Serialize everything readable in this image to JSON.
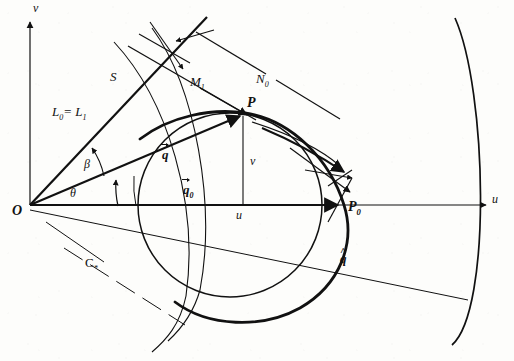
{
  "figure": {
    "style": "hand-drawn line diagram, black ink on off-white paper",
    "width": 514,
    "height": 361,
    "ink_color": "#111111",
    "paper_color": "#fdfdfb"
  },
  "axes": {
    "vertical_label": "v",
    "horizontal_label": "u",
    "origin_label": "O"
  },
  "points": [
    {
      "id": "origin",
      "label": "O",
      "x": 30,
      "y": 205
    },
    {
      "id": "p",
      "label": "P",
      "x": 243,
      "y": 113
    },
    {
      "id": "p0",
      "label": "P",
      "sub": "0",
      "x": 344,
      "y": 205
    }
  ],
  "labels": {
    "s_line": "S",
    "l_equality": "L",
    "l_equality_sub0": "0",
    "l_equality_mid": "= L",
    "l_equality_sub1": "1",
    "m1": "M",
    "m1_sub": "1",
    "n0": "N",
    "n0_sub": "0",
    "c_star": "C",
    "c_star_sub": "*",
    "q_vector": "q",
    "q0_vector": "q",
    "q0_sub": "0",
    "q_hat": "q",
    "coord_v": "v",
    "coord_u": "u",
    "angle_beta": "β",
    "angle_theta": "θ"
  },
  "geometry": {
    "description": "u-v velocity plane with origin O, unit-type circle, bold characteristic arc through P and P0, ray OP (vector q), ray OP0 (vector q0), an inclined straight line S through the origin region, parallel dashed/solid construction lines M1 and N0, a lower ray q-hat, and a large right-hand circular arc.",
    "circle": {
      "cx": 230,
      "cy": 205,
      "r": 92,
      "stroke_width": 1.4
    },
    "bold_arc": {
      "from": "left of P",
      "through": "P",
      "to": "P0",
      "stroke_width": 2.6
    },
    "right_arc": {
      "cx": -60,
      "cy": 200,
      "r": 525,
      "stroke_width": 1.6
    },
    "inner_arc": {
      "cx": -140,
      "cy": 200,
      "r": 355,
      "stroke_width": 1.1
    },
    "angle_beta_value_deg": 0,
    "angle_theta_value_deg": 0
  }
}
